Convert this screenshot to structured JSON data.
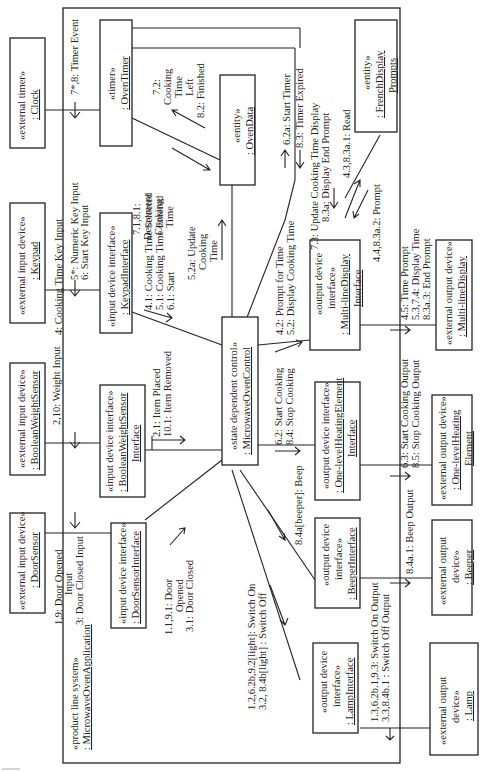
{
  "system": {
    "stereotype": "«product line system»",
    "name": ": MicrowaveOvenApplication"
  },
  "objects": {
    "clock": {
      "stereotype": "«external timer»",
      "name": ": Clock"
    },
    "keypad": {
      "stereotype": "«external input device»",
      "name": ": Keypad"
    },
    "weight_sensor": {
      "stereotype": "«external input device»",
      "name": ": BooleanWeightSensor"
    },
    "door_sensor": {
      "stereotype": "«external input device»",
      "name": ": DoorSensor"
    },
    "oven_timer": {
      "stereotype": "«timer»",
      "name": ": OvenTimer"
    },
    "keypad_interface": {
      "stereotype": "«input device interface»",
      "name": ": KeypadInterface"
    },
    "weight_sensor_interface": {
      "stereotype": "«input device interface»",
      "name1": ": BooleanWeightSensor",
      "name2": "Interface"
    },
    "door_sensor_interface": {
      "stereotype": "«input device interface»",
      "name": ": DoorSensorInterface"
    },
    "oven_data": {
      "stereotype": "«entity»",
      "name": ": OvenData"
    },
    "control": {
      "stereotype": "«state dependent control»",
      "name": ": MicrowaveOvenControl"
    },
    "display_interface": {
      "stereotype1": "«output device",
      "stereotype2": "interface»",
      "name1": ": Multi-lineDisplay",
      "name2": "Interface"
    },
    "heating_interface": {
      "stereotype": "«output device interface»",
      "name1": ": One-levelHeatingElement",
      "name2": "Interface"
    },
    "beeper_interface": {
      "stereotype1": "«output device",
      "stereotype2": "interface»",
      "name": ": BeeperInterface"
    },
    "lamp_interface": {
      "stereotype1": "«output device",
      "stereotype2": "interface»",
      "name": ": LampInterface"
    },
    "french_prompts": {
      "stereotype": "«entity»",
      "name1": ": FrenchDisplay",
      "name2": "Prompts"
    },
    "display": {
      "stereotype": "«external output device»",
      "name": ": Multi-lineDisplay"
    },
    "heating_element": {
      "stereotype": "«external output device»",
      "name1": ": One-levelHeating",
      "name2": "Element"
    },
    "beeper": {
      "stereotype1": "«external output",
      "stereotype2": "device»",
      "name": ": Beeper"
    },
    "lamp": {
      "stereotype1": "«external output",
      "stereotype2": "device»",
      "name": ": Lamp"
    }
  },
  "messages": {
    "timer_event": "7*,8:  Timer Event",
    "keypad_input_1": "4: Cooking Time Key Input",
    "keypad_input_2": "5*: Numeric Key Input",
    "keypad_input_3": "6: Start Key Input",
    "weight_input": "2,10: Weight Input",
    "door_input_1": "1,9: Door Opened",
    "door_input_2": "Input",
    "door_input_3": "3: Door Closed Input",
    "decrement_1": "7.1,8.1:",
    "decrement_2": "Decrement",
    "decrement_3": "Cooking",
    "decrement_4": "Time",
    "cooking_left_1": "7.2:",
    "cooking_left_2": "Cooking",
    "cooking_left_3": "Time",
    "cooking_left_4": "Left",
    "cooking_left_5": "8.2: Finished",
    "keypad_ctrl_1": "4.1: Cooking Time Selected",
    "keypad_ctrl_2": "5.1: Cooking Time Entered",
    "keypad_ctrl_3": "6.1: Start",
    "update_cooking_1": "5.2a: Update",
    "update_cooking_2": "Cooking",
    "update_cooking_3": "Time",
    "start_timer": "6.2a: Start Timer",
    "timer_expired": "8.3: Timer Expired",
    "update_display_1": "7.3: Update Cooking Time Display",
    "update_display_2": "8.3a: Display End Prompt",
    "read_prompts": "4.3,8.3a.1: Read",
    "prompt": "4.4,8.3a.2:  Prompt",
    "prompt_time_1": "4.2: Prompt for Time",
    "prompt_time_2": "5.2: Display Cooking Time",
    "display_out_1": "4.5: Time Prompt",
    "display_out_2": "5.3,7.4: Display Time",
    "display_out_3": "8.3a.3:  End Prompt",
    "item_1": "2.1: Item Placed",
    "item_2": "10.1: Item Removed",
    "cooking_1": "6.2: Start Cooking",
    "cooking_2": "8.4: Stop Cooking",
    "heating_out_1": "6.3: Start Cooking Output",
    "heating_out_2": "8.5: Stop Cooking Output",
    "beep": "8.4a[beeper]: Beep",
    "beep_out": "8.4a.1: Beep Output",
    "door_ctrl_1": "1.1,9.1: Door",
    "door_ctrl_2": "Opened",
    "door_ctrl_3": "3.1: Door Closed",
    "lamp_ctrl_1": "1.2,6.2b,9.2[light]: Switch On",
    "lamp_ctrl_2": "3.2, 8.4b[light] : Switch Off",
    "lamp_out_1": "1.3,6.2b.1,9.3: Switch On Output",
    "lamp_out_2": "3.3,8.4b.1 : Switch Off Output"
  }
}
